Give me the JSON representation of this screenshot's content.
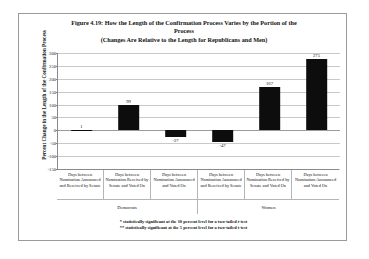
{
  "figure": {
    "title_line1": "Figure 4.19: How the Length of the Confirmation Process Varies by the Portion of the",
    "title_line2": "Process",
    "title_line3": "(Changes Are Relative to the Length for Republicans and Men)"
  },
  "footnotes": [
    "* statistically significant at the 10 percent level for a two-tailed t-test",
    "** statistically significant at the 5 percent level for a two-tailed t-test"
  ],
  "chart_data": {
    "type": "bar",
    "title": "Figure 4.19: How the Length of the Confirmation Process Varies by the Portion of the Process (Changes Are Relative to the Length for Republicans and Men)",
    "xlabel": "",
    "ylabel": "Percent Change in the Length of the Confirmation Process",
    "ylim": [
      -150,
      300
    ],
    "ytick_step": 50,
    "yticks": [
      300,
      250,
      200,
      150,
      100,
      50,
      0,
      -50,
      -100,
      -150
    ],
    "ytick_labels": [
      "300",
      "250",
      "200",
      "150",
      "100",
      "50",
      "0",
      "-50",
      "-100",
      "-150"
    ],
    "grid": true,
    "legend": "none",
    "bar_color": "#0d0d0d",
    "categories": [
      "Days between Nomination Announced and Received by Senate",
      "Days between Nomination Received by Senate and Voted On",
      "Days between Nomination Announced and Voted On",
      "Days between Nomination Announced and Received by Senate",
      "Days between Nomination Received by Senate and Voted On",
      "Days between Nomination Announced and Voted On"
    ],
    "values": [
      1,
      99,
      -27,
      -47,
      167,
      275
    ],
    "value_labels": [
      "1",
      "99",
      "-27",
      "-47",
      "167",
      "275"
    ],
    "groups": [
      {
        "label": "Democrats",
        "span": 3
      },
      {
        "label": "Women",
        "span": 3
      }
    ]
  }
}
